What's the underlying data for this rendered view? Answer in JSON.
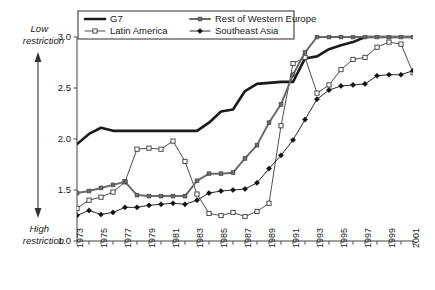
{
  "chart_data": {
    "type": "line",
    "title": "",
    "xlabel": "",
    "ylabel": "",
    "xlim": [
      1973,
      2001
    ],
    "ylim": [
      1.0,
      3.0
    ],
    "grid": false,
    "legend_position": "top-center",
    "y_ticks": [
      "3.0",
      "2.5",
      "2.0",
      "1.5",
      "1.0"
    ],
    "y_tick_values": [
      3.0,
      2.5,
      2.0,
      1.5,
      1.0
    ],
    "x_ticks": [
      "1973",
      "1975",
      "1977",
      "1979",
      "1981",
      "1983",
      "1985",
      "1987",
      "1989",
      "1991",
      "1993",
      "1995",
      "1997",
      "1999",
      "2001"
    ],
    "x_all_years": [
      1973,
      1974,
      1975,
      1976,
      1977,
      1978,
      1979,
      1980,
      1981,
      1982,
      1983,
      1984,
      1985,
      1986,
      1987,
      1988,
      1989,
      1990,
      1991,
      1992,
      1993,
      1994,
      1995,
      1996,
      1997,
      1998,
      1999,
      2000,
      2001
    ],
    "annotations": {
      "top_axis_note": "Low restriction",
      "top_axis_note_line1": "Low",
      "top_axis_note_line2": "restriction",
      "bottom_axis_note": "High restriction",
      "bottom_axis_note_line1": "High",
      "bottom_axis_note_line2": "restriction"
    },
    "series": [
      {
        "name": "G7",
        "color": "#1a1a1a",
        "width": 2.6,
        "marker": "none",
        "x": [
          1973,
          1974,
          1975,
          1976,
          1977,
          1978,
          1979,
          1980,
          1981,
          1982,
          1983,
          1984,
          1985,
          1986,
          1987,
          1988,
          1989,
          1990,
          1991,
          1992,
          1993,
          1994,
          1995,
          1996,
          1997,
          1998,
          1999,
          2000,
          2001
        ],
        "values": [
          1.95,
          2.05,
          2.11,
          2.08,
          2.08,
          2.08,
          2.08,
          2.08,
          2.08,
          2.08,
          2.08,
          2.16,
          2.27,
          2.29,
          2.47,
          2.54,
          2.55,
          2.56,
          2.56,
          2.79,
          2.81,
          2.88,
          2.92,
          2.95,
          3.0,
          3.0,
          3.0,
          3.0,
          3.0
        ]
      },
      {
        "name": "Latin America",
        "color": "#3a3a3a",
        "width": 0.9,
        "marker": "open-square",
        "x": [
          1973,
          1974,
          1975,
          1976,
          1977,
          1978,
          1979,
          1980,
          1981,
          1982,
          1983,
          1984,
          1985,
          1986,
          1987,
          1988,
          1989,
          1990,
          1991,
          1992,
          1993,
          1994,
          1995,
          1996,
          1997,
          1998,
          1999,
          2000,
          2001
        ],
        "values": [
          1.32,
          1.4,
          1.43,
          1.48,
          1.58,
          1.9,
          1.91,
          1.9,
          1.98,
          1.78,
          1.46,
          1.27,
          1.25,
          1.28,
          1.24,
          1.29,
          1.37,
          2.13,
          2.74,
          2.8,
          2.45,
          2.53,
          2.68,
          2.78,
          2.8,
          2.9,
          2.95,
          2.93,
          2.65
        ]
      },
      {
        "name": "Rest of Western Europe",
        "color": "#6b6b6b",
        "width": 2.0,
        "marker": "filled-square",
        "x": [
          1973,
          1974,
          1975,
          1976,
          1977,
          1978,
          1979,
          1980,
          1981,
          1982,
          1983,
          1984,
          1985,
          1986,
          1987,
          1988,
          1989,
          1990,
          1991,
          1992,
          1993,
          1994,
          1995,
          1996,
          1997,
          1998,
          1999,
          2000,
          2001
        ],
        "values": [
          1.47,
          1.49,
          1.52,
          1.55,
          1.58,
          1.45,
          1.44,
          1.44,
          1.44,
          1.44,
          1.59,
          1.66,
          1.66,
          1.67,
          1.81,
          1.94,
          2.16,
          2.34,
          2.63,
          2.85,
          3.0,
          3.0,
          3.0,
          3.0,
          3.0,
          3.0,
          3.0,
          3.0,
          3.0
        ]
      },
      {
        "name": "Southeast Asia",
        "color": "#111111",
        "width": 0.9,
        "marker": "filled-diamond",
        "x": [
          1973,
          1974,
          1975,
          1976,
          1977,
          1978,
          1979,
          1980,
          1981,
          1982,
          1983,
          1984,
          1985,
          1986,
          1987,
          1988,
          1989,
          1990,
          1991,
          1992,
          1993,
          1994,
          1995,
          1996,
          1997,
          1998,
          1999,
          2000,
          2001
        ],
        "values": [
          1.25,
          1.3,
          1.26,
          1.28,
          1.33,
          1.33,
          1.35,
          1.36,
          1.37,
          1.36,
          1.4,
          1.47,
          1.49,
          1.5,
          1.51,
          1.57,
          1.71,
          1.84,
          1.99,
          2.19,
          2.39,
          2.48,
          2.52,
          2.53,
          2.54,
          2.62,
          2.63,
          2.63,
          2.67
        ]
      }
    ]
  },
  "legend": {
    "items": [
      {
        "label": "G7",
        "key": "g7"
      },
      {
        "label": "Rest of Western Europe",
        "key": "rest-of-western-europe"
      },
      {
        "label": "Latin America",
        "key": "latin-america"
      },
      {
        "label": "Southeast Asia",
        "key": "southeast-asia"
      }
    ]
  }
}
